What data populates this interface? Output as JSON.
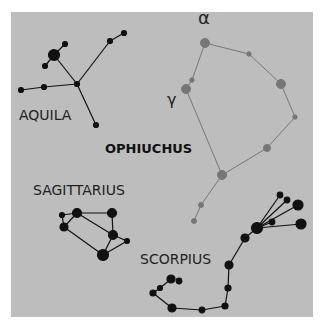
{
  "figure": {
    "background": "#bdbdbd",
    "colors": {
      "dark": "#111111",
      "ophiuchus": "#707070"
    }
  },
  "labels": {
    "aquila": "AQUILA",
    "ophiuchus": "OPHIUCHUS",
    "sagittarius": "SAGITTARIUS",
    "scorpius": "SCORPIUS",
    "alpha": "α",
    "gamma": "γ"
  }
}
